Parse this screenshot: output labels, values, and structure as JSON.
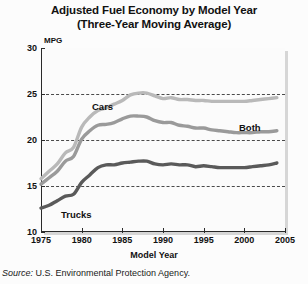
{
  "title": {
    "line1": "Adjusted Fuel Economy by Model Year",
    "line2": "(Three-Year Moving Average)"
  },
  "source": {
    "label": "Source:",
    "text": "U.S. Environmental Protection Agency."
  },
  "chart_data": {
    "type": "line",
    "title": "Adjusted Fuel Economy by Model Year (Three-Year Moving Average)",
    "xlabel": "Model Year",
    "ylabel": "MPG",
    "y_unit_label": "MPG",
    "xlim": [
      1975,
      2005
    ],
    "ylim": [
      10,
      30
    ],
    "xticks": [
      1975,
      1980,
      1985,
      1990,
      1995,
      2000,
      2005
    ],
    "yticks": [
      10,
      15,
      20,
      25,
      30
    ],
    "gridlines": [
      15,
      20,
      25
    ],
    "grid": "horizontal-dashed",
    "legend": "inline-labels",
    "colors": {
      "cars": "#b9b9b9",
      "both": "#9a9a9a",
      "trucks": "#5a5a5a",
      "axis": "#2a2a2a",
      "gridline": "#4a4a4a",
      "plot_background": "#fbfbfb",
      "page_background": "#fcfcfc"
    },
    "x": [
      1975,
      1976,
      1977,
      1978,
      1979,
      1980,
      1981,
      1982,
      1983,
      1984,
      1985,
      1986,
      1987,
      1988,
      1989,
      1990,
      1991,
      1992,
      1993,
      1994,
      1995,
      1996,
      1997,
      1998,
      1999,
      2000,
      2001,
      2002,
      2003,
      2004
    ],
    "series": [
      {
        "name": "Cars",
        "color": "#b9b9b9",
        "values": [
          15.8,
          16.6,
          17.4,
          18.6,
          19.2,
          21.4,
          22.5,
          23.2,
          23.5,
          23.9,
          24.3,
          24.9,
          25.1,
          25.1,
          24.8,
          24.5,
          24.6,
          24.4,
          24.4,
          24.3,
          24.3,
          24.2,
          24.2,
          24.2,
          24.2,
          24.2,
          24.3,
          24.4,
          24.5,
          24.6
        ]
      },
      {
        "name": "Both",
        "color": "#9a9a9a",
        "values": [
          15.2,
          15.9,
          16.6,
          17.7,
          18.2,
          20.1,
          21.0,
          21.6,
          21.7,
          21.9,
          22.3,
          22.6,
          22.6,
          22.5,
          22.1,
          21.9,
          21.9,
          21.6,
          21.5,
          21.3,
          21.3,
          21.1,
          21.0,
          20.9,
          20.8,
          20.8,
          20.8,
          20.9,
          20.9,
          21.0
        ]
      },
      {
        "name": "Trucks",
        "color": "#5a5a5a",
        "values": [
          12.6,
          12.9,
          13.4,
          13.9,
          14.1,
          15.4,
          16.2,
          17.0,
          17.3,
          17.3,
          17.5,
          17.6,
          17.7,
          17.7,
          17.4,
          17.3,
          17.4,
          17.3,
          17.3,
          17.1,
          17.2,
          17.1,
          17.0,
          17.0,
          17.0,
          17.0,
          17.1,
          17.2,
          17.3,
          17.5
        ]
      }
    ],
    "annotations": [
      {
        "text": "Cars",
        "near_year": 1983,
        "near_value": 26.2
      },
      {
        "text": "Both",
        "near_year": 2000,
        "near_value": 22.0
      },
      {
        "text": "Trucks",
        "near_year": 1978,
        "near_value": 11.4
      }
    ]
  }
}
